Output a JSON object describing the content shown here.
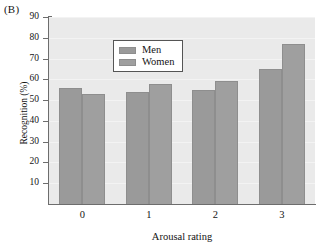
{
  "panel": {
    "label": "(B)"
  },
  "chart_data": {
    "type": "bar",
    "title": "",
    "panel_label": "(B)",
    "xlabel": "Arousal rating",
    "ylabel": "Recognition (%)",
    "categories": [
      "0",
      "1",
      "2",
      "3"
    ],
    "series": [
      {
        "name": "Men",
        "values": [
          56,
          54,
          55,
          65
        ]
      },
      {
        "name": "Women",
        "values": [
          53,
          58,
          59,
          77
        ]
      }
    ],
    "ylim": [
      0,
      90
    ],
    "yticks": [
      10,
      20,
      30,
      40,
      50,
      60,
      70,
      80,
      90
    ],
    "ytick_labels": [
      "10",
      "20",
      "30",
      "40",
      "50",
      "60",
      "70",
      "80",
      "90"
    ],
    "grid": true,
    "grid_axis": "y",
    "legend_position": "upper left",
    "legend_entries": [
      "Men",
      "Women"
    ],
    "colors": {
      "men_bar": "#9a9a9a",
      "women_bar": "#9f9f9f",
      "plot_background": "#eaeaea",
      "axis": "#6d6d6d",
      "gridline": "#f3f3f3",
      "text": "#141414",
      "legend_background": "#ffffff",
      "legend_border": "#555555"
    }
  }
}
